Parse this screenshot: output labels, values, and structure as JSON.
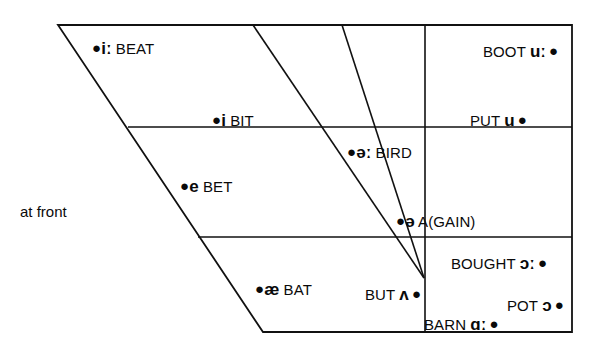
{
  "figure": {
    "title": "",
    "background_color": "#ffffff",
    "line_color": "#111111",
    "text_color": "#0a0a0a"
  },
  "annotations": {
    "at_front": "at front"
  },
  "chart_data": {
    "type": "scatter",
    "title": "",
    "xlabel": "",
    "ylabel": "",
    "subtitle": "",
    "grid": true,
    "legend_position": "none",
    "axis_note": "at front",
    "quadrilateral": {
      "top_left": [
        58,
        25
      ],
      "top_right": [
        572,
        25
      ],
      "bottom_right": [
        572,
        332
      ],
      "bottom_left": [
        263,
        332
      ]
    },
    "horizontal_lines": [
      {
        "name": "close-mid-divider",
        "y": 127,
        "x_start": 128,
        "x_end": 572
      },
      {
        "name": "open-mid-divider",
        "y": 237,
        "x_start": 198,
        "x_end": 572
      }
    ],
    "vertical_lines": [
      {
        "name": "central-back-divider",
        "x": 425,
        "y_start": 25,
        "y_end": 332
      }
    ],
    "converging_lines": [
      {
        "name": "front-central-line-1",
        "from": [
          253,
          25
        ],
        "to": [
          424,
          278
        ]
      },
      {
        "name": "front-central-line-2",
        "from": [
          342,
          25
        ],
        "to": [
          424,
          278
        ]
      }
    ],
    "points": [
      {
        "id": "beat",
        "symbol": "iː",
        "word": "BEAT",
        "x": 92,
        "y": 40,
        "dot_side": "left",
        "order": "dot-symbol-word"
      },
      {
        "id": "bit",
        "symbol": "i",
        "word": "BIT",
        "x": 212,
        "y": 112,
        "dot_side": "left",
        "order": "dot-symbol-word"
      },
      {
        "id": "bet",
        "symbol": "e",
        "word": "BET",
        "x": 180,
        "y": 178,
        "dot_side": "left",
        "order": "dot-symbol-word"
      },
      {
        "id": "bat",
        "symbol": "æ",
        "word": "BAT",
        "x": 255,
        "y": 281,
        "dot_side": "left",
        "order": "dot-symbol-word"
      },
      {
        "id": "bird",
        "symbol": "əː",
        "word": "BIRD",
        "x": 347,
        "y": 144,
        "dot_side": "left",
        "order": "dot-symbol-word"
      },
      {
        "id": "again",
        "symbol": "ə",
        "word": "A(GAIN)",
        "x": 396,
        "y": 213,
        "dot_side": "left",
        "order": "dot-symbol-word"
      },
      {
        "id": "but",
        "symbol": "ʌ",
        "word": "BUT",
        "x": 365,
        "y": 286,
        "dot_side": "right",
        "order": "word-symbol-dot"
      },
      {
        "id": "boot",
        "symbol": "uː",
        "word": "BOOT",
        "x": 483,
        "y": 43,
        "dot_side": "right",
        "order": "word-symbol-dot"
      },
      {
        "id": "put",
        "symbol": "u",
        "word": "PUT",
        "x": 470,
        "y": 112,
        "dot_side": "right",
        "order": "word-symbol-dot"
      },
      {
        "id": "bought",
        "symbol": "ɔː",
        "word": "BOUGHT",
        "x": 451,
        "y": 255,
        "dot_side": "right",
        "order": "word-symbol-dot"
      },
      {
        "id": "pot",
        "symbol": "ɔ",
        "word": "POT",
        "x": 507,
        "y": 297,
        "dot_side": "right",
        "order": "word-symbol-dot"
      },
      {
        "id": "barn",
        "symbol": "ɑː",
        "word": "BARN",
        "x": 424,
        "y": 316,
        "dot_side": "right",
        "order": "word-symbol-dot"
      }
    ]
  }
}
